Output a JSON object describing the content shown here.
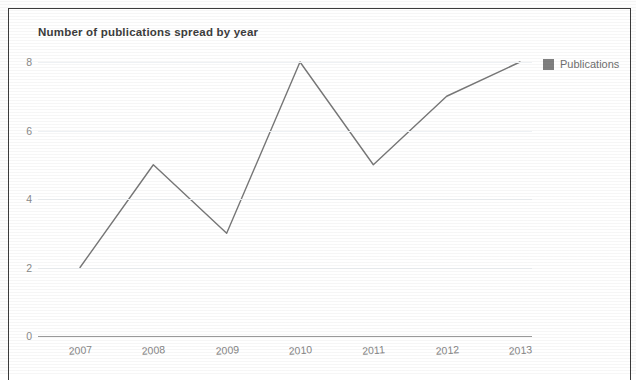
{
  "chart_data": {
    "type": "line",
    "title": "Number of publications spread by year",
    "xlabel": "",
    "ylabel": "",
    "categories": [
      "2007",
      "2008",
      "2009",
      "2010",
      "2011",
      "2012",
      "2013"
    ],
    "series": [
      {
        "name": "Publications",
        "values": [
          2,
          5,
          3,
          8,
          5,
          7,
          8
        ],
        "color": "#777777"
      }
    ],
    "ylim": [
      0,
      8
    ],
    "yticks": [
      0,
      2,
      4,
      6,
      8
    ],
    "ytick_labels": [
      "0",
      "2",
      "4",
      "6",
      "8"
    ],
    "grid": true,
    "grid_axis": "y",
    "legend": {
      "position": "right",
      "entries": [
        {
          "label": "Publications",
          "color": "#7f7f7f"
        }
      ]
    }
  },
  "legend": {
    "label": "Publications"
  }
}
